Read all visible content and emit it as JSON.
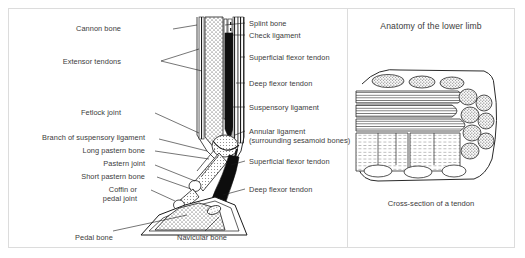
{
  "figure": {
    "title": "Anatomy of the lower limb",
    "caption": "Cross-section of a tendon",
    "line_color": "#1a1a1a",
    "text_color": "#3b3b3b",
    "frame_color": "#dcdcdc",
    "background": "#ffffff",
    "width": 525,
    "height": 258
  },
  "left_labels": [
    {
      "id": "cannon-bone",
      "text": "Cannon bone",
      "x": 112,
      "y": 19,
      "leader_x2": 222,
      "leader_y2": 22
    },
    {
      "id": "extensor-tendons",
      "text": "Extensor tendons",
      "x": 86,
      "y": 53,
      "leader_x2": 222,
      "leader_y2": 58
    },
    {
      "id": "fetlock-joint",
      "text": "Fetlock joint",
      "x": 108,
      "y": 104,
      "leader_x2": 222,
      "leader_y2": 112
    },
    {
      "id": "branch-of-suspensory-ligament",
      "text": "Branch of suspensory ligament",
      "x": 32,
      "y": 128,
      "leader_x2": 222,
      "leader_y2": 133
    },
    {
      "id": "long-pastern-bone",
      "text": "Long pastern bone",
      "x": 76,
      "y": 143,
      "leader_x2": 222,
      "leader_y2": 146
    },
    {
      "id": "pastern-joint",
      "text": "Pastern joint",
      "x": 100,
      "y": 157,
      "leader_x2": 222,
      "leader_y2": 158
    },
    {
      "id": "short-pastern-bone",
      "text": "Short pastern bone",
      "x": 70,
      "y": 170,
      "leader_x2": 222,
      "leader_y2": 170
    },
    {
      "id": "coffin-or-pedal-joint",
      "text": "Coffin or",
      "x": 100,
      "y": 183,
      "leader_x2": 222,
      "leader_y2": 182
    },
    {
      "id": "coffin-or-pedal-joint-line2",
      "text": "pedal joint",
      "x": 100,
      "y": 192,
      "leader_x2": 0,
      "leader_y2": 0
    }
  ],
  "bottom_labels": [
    {
      "id": "pedal-bone",
      "text": "Pedal bone",
      "x": 80,
      "y": 230,
      "leader_x2": 160,
      "leader_y2": 205
    },
    {
      "id": "navicular-bone",
      "text": "Navicular bone",
      "x": 178,
      "y": 230,
      "leader_x2": 214,
      "leader_y2": 200
    }
  ],
  "right_labels": [
    {
      "id": "splint-bone",
      "text": "Splint bone",
      "x": 238,
      "y": 19,
      "leader_x1": 228,
      "leader_y1": 22
    },
    {
      "id": "check-ligament",
      "text": "Check ligament",
      "x": 238,
      "y": 33,
      "leader_x1": 228,
      "leader_y1": 36
    },
    {
      "id": "superficial-flexor-tendon-upper",
      "text": "Superficial flexor tendon",
      "x": 238,
      "y": 54,
      "leader_x1": 228,
      "leader_y1": 57
    },
    {
      "id": "deep-flexor-tendon-upper",
      "text": "Deep flexor tendon",
      "x": 238,
      "y": 79,
      "leader_x1": 228,
      "leader_y1": 82
    },
    {
      "id": "suspensory-ligament",
      "text": "Suspensory ligament",
      "x": 238,
      "y": 103,
      "leader_x1": 228,
      "leader_y1": 106
    },
    {
      "id": "annular-ligament",
      "text": "Annular ligament",
      "x": 238,
      "y": 128,
      "leader_x1": 228,
      "leader_y1": 131
    },
    {
      "id": "annular-ligament-sub",
      "text": "(surrounding sesamoid bones)",
      "x": 238,
      "y": 137,
      "leader_x1": 0,
      "leader_y1": 0
    },
    {
      "id": "superficial-flexor-tendon-lower",
      "text": "Superficial flexor tendon",
      "x": 238,
      "y": 158,
      "leader_x1": 228,
      "leader_y1": 160
    },
    {
      "id": "deep-flexor-tendon-lower",
      "text": "Deep flexor tendon",
      "x": 238,
      "y": 185,
      "leader_x1": 228,
      "leader_y1": 186
    }
  ]
}
